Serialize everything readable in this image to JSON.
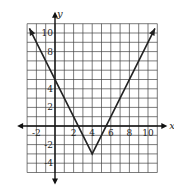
{
  "chart_data": {
    "type": "line",
    "title": "",
    "xlabel": "x",
    "ylabel": "y",
    "function": "y = 2|x - 4| - 3",
    "vertex": [
      4,
      -3
    ],
    "x": [
      -2.75,
      4,
      10.75
    ],
    "y": [
      10.5,
      -3,
      10.5
    ],
    "xlim": [
      -3,
      11
    ],
    "ylim": [
      -5,
      11
    ],
    "x_ticks": [
      -2,
      2,
      4,
      6,
      8,
      10
    ],
    "y_ticks": [
      -4,
      -2,
      2,
      4,
      8,
      10
    ],
    "x_tick_labels": [
      "-2",
      "2",
      "4",
      "6",
      "8",
      "10"
    ],
    "y_tick_labels": [
      "-4",
      "-2",
      "2",
      "4",
      "8",
      "10"
    ],
    "grid": true,
    "arrows": true,
    "color": "#222222"
  },
  "labels": {
    "x_axis": "x",
    "y_axis": "y"
  }
}
